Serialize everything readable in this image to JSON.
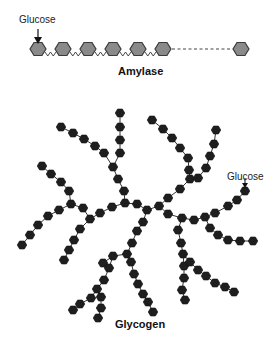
{
  "amylase": {
    "title": "Amylase",
    "glucose_label": "Glucose",
    "hex_fill": "#8a8a8a",
    "hex_stroke": "#3a3a3a",
    "units_x": [
      38,
      63,
      88,
      113,
      138,
      163
    ],
    "last_unit_x": 241,
    "y": 49
  },
  "glycogen": {
    "title": "Glycogen",
    "glucose_label": "Glucose",
    "hex_fill": "#1e1e1e",
    "bond_color": "#333333",
    "branches": [
      [
        [
          120,
          113
        ],
        [
          120,
          127
        ],
        [
          120,
          140
        ],
        [
          120,
          153
        ],
        [
          113,
          167
        ],
        [
          118,
          179
        ],
        [
          124,
          191
        ],
        [
          125,
          203
        ]
      ],
      [
        [
          61,
          127
        ],
        [
          73,
          133
        ],
        [
          84,
          139
        ],
        [
          95,
          146
        ],
        [
          104,
          153
        ],
        [
          113,
          167
        ]
      ],
      [
        [
          42,
          166
        ],
        [
          51,
          174
        ],
        [
          61,
          182
        ],
        [
          69,
          191
        ],
        [
          71,
          204
        ],
        [
          83,
          208
        ]
      ],
      [
        [
          22,
          245
        ],
        [
          30,
          235
        ],
        [
          38,
          225
        ],
        [
          48,
          216
        ],
        [
          59,
          210
        ],
        [
          71,
          204
        ]
      ],
      [
        [
          125,
          203
        ],
        [
          112,
          207
        ],
        [
          100,
          213
        ],
        [
          90,
          219
        ],
        [
          83,
          208
        ]
      ],
      [
        [
          90,
          219
        ],
        [
          80,
          229
        ],
        [
          74,
          240
        ],
        [
          69,
          250
        ],
        [
          64,
          260
        ]
      ],
      [
        [
          152,
          120
        ],
        [
          163,
          129
        ],
        [
          172,
          138
        ],
        [
          180,
          148
        ],
        [
          188,
          158
        ],
        [
          189,
          170
        ],
        [
          190,
          179
        ],
        [
          180,
          189
        ],
        [
          168,
          198
        ],
        [
          159,
          206
        ],
        [
          147,
          210
        ],
        [
          137,
          204
        ],
        [
          125,
          203
        ]
      ],
      [
        [
          216,
          130
        ],
        [
          214,
          144
        ],
        [
          210,
          156
        ],
        [
          206,
          168
        ],
        [
          198,
          178
        ],
        [
          190,
          179
        ]
      ],
      [
        [
          245,
          191
        ],
        [
          237,
          200
        ],
        [
          228,
          206
        ],
        [
          215,
          213
        ],
        [
          205,
          217
        ],
        [
          194,
          220
        ],
        [
          182,
          218
        ]
      ],
      [
        [
          159,
          206
        ],
        [
          168,
          214
        ],
        [
          182,
          218
        ]
      ],
      [
        [
          182,
          218
        ],
        [
          178,
          230
        ],
        [
          181,
          243
        ],
        [
          183,
          254
        ],
        [
          184,
          266
        ],
        [
          184,
          278
        ],
        [
          182,
          290
        ],
        [
          185,
          300
        ]
      ],
      [
        [
          205,
          217
        ],
        [
          210,
          228
        ],
        [
          218,
          235
        ],
        [
          228,
          240
        ],
        [
          240,
          241
        ],
        [
          253,
          241
        ]
      ],
      [
        [
          183,
          254
        ],
        [
          190,
          262
        ],
        [
          198,
          270
        ],
        [
          206,
          276
        ],
        [
          215,
          283
        ],
        [
          225,
          287
        ],
        [
          234,
          292
        ]
      ],
      [
        [
          147,
          210
        ],
        [
          143,
          222
        ],
        [
          137,
          231
        ],
        [
          132,
          243
        ],
        [
          127,
          254
        ],
        [
          113,
          256
        ],
        [
          103,
          263
        ]
      ],
      [
        [
          127,
          254
        ],
        [
          131,
          262
        ],
        [
          134,
          274
        ],
        [
          138,
          284
        ],
        [
          143,
          294
        ],
        [
          148,
          302
        ],
        [
          153,
          312
        ]
      ],
      [
        [
          113,
          256
        ],
        [
          109,
          268
        ],
        [
          104,
          280
        ],
        [
          97,
          289
        ],
        [
          91,
          298
        ],
        [
          80,
          304
        ],
        [
          73,
          310
        ]
      ],
      [
        [
          97,
          289
        ],
        [
          101,
          297
        ],
        [
          101,
          308
        ],
        [
          98,
          318
        ]
      ]
    ],
    "glucose_pointer": [
      245,
      191
    ]
  }
}
